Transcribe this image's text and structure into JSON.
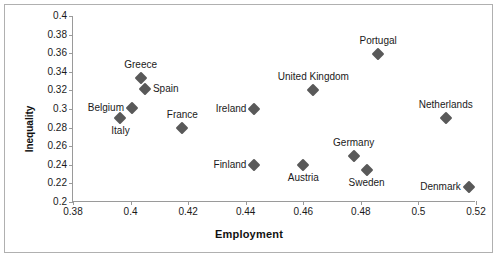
{
  "chart_data": {
    "type": "scatter",
    "title": "",
    "xlabel": "Employment",
    "ylabel": "Inequality",
    "xlim": [
      0.38,
      0.52
    ],
    "ylim": [
      0.2,
      0.4
    ],
    "xticks": [
      "0.38",
      "0.4",
      "0.42",
      "0.44",
      "0.46",
      "0.48",
      "0.5",
      "0.52"
    ],
    "xtick_values": [
      0.38,
      0.4,
      0.42,
      0.44,
      0.46,
      0.48,
      0.5,
      0.52
    ],
    "yticks": [
      "0.2",
      "0.22",
      "0.24",
      "0.26",
      "0.28",
      "0.3",
      "0.32",
      "0.34",
      "0.36",
      "0.38",
      "0.4"
    ],
    "ytick_values": [
      0.2,
      0.22,
      0.24,
      0.26,
      0.28,
      0.3,
      0.32,
      0.34,
      0.36,
      0.38,
      0.4
    ],
    "grid": false,
    "legend": false,
    "marker_color": "#595959",
    "marker_shape": "diamond",
    "points": [
      {
        "label": "Italy",
        "x": 0.3965,
        "y": 0.29,
        "label_pos": "below"
      },
      {
        "label": "Belgium",
        "x": 0.4005,
        "y": 0.301,
        "label_pos": "left"
      },
      {
        "label": "Greece",
        "x": 0.4035,
        "y": 0.333,
        "label_pos": "above"
      },
      {
        "label": "Spain",
        "x": 0.405,
        "y": 0.321,
        "label_pos": "right"
      },
      {
        "label": "France",
        "x": 0.418,
        "y": 0.28,
        "label_pos": "above"
      },
      {
        "label": "Ireland",
        "x": 0.443,
        "y": 0.3,
        "label_pos": "left"
      },
      {
        "label": "Finland",
        "x": 0.443,
        "y": 0.24,
        "label_pos": "left"
      },
      {
        "label": "Austria",
        "x": 0.46,
        "y": 0.24,
        "label_pos": "below"
      },
      {
        "label": "United Kingdom",
        "x": 0.4635,
        "y": 0.32,
        "label_pos": "above"
      },
      {
        "label": "Germany",
        "x": 0.4775,
        "y": 0.25,
        "label_pos": "above"
      },
      {
        "label": "Sweden",
        "x": 0.482,
        "y": 0.234,
        "label_pos": "below"
      },
      {
        "label": "Portugal",
        "x": 0.486,
        "y": 0.359,
        "label_pos": "above"
      },
      {
        "label": "Netherlands",
        "x": 0.5095,
        "y": 0.29,
        "label_pos": "above"
      },
      {
        "label": "Denmark",
        "x": 0.5175,
        "y": 0.216,
        "label_pos": "left"
      }
    ]
  }
}
